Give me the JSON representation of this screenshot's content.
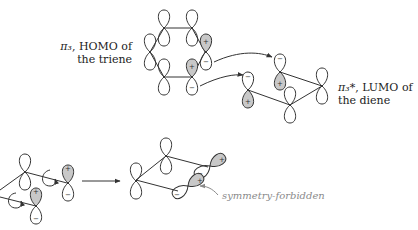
{
  "labels": {
    "homo_symbol": "π₃",
    "homo_line1_rest": ", HOMO of",
    "homo_line2": "the triene",
    "lumo_symbol": "π₃*",
    "lumo_line1_rest": ", LUMO of",
    "lumo_line2": "the diene",
    "forbidden": "symmetry-forbidden"
  },
  "signs": {
    "plus": "+",
    "minus": "−"
  },
  "colors": {
    "stroke": "#333333",
    "shade": "#c8c8c8",
    "annotation": "#8a8a8a"
  }
}
